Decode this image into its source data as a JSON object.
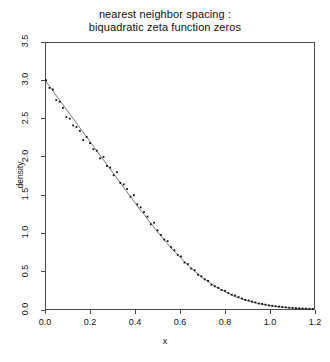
{
  "chart_data": {
    "type": "line",
    "title": "nearest neighbor spacing : biquadratic zeta function zeros",
    "title_lines": [
      "nearest neighbor spacing :",
      "biquadratic zeta function zeros"
    ],
    "xlabel": "x",
    "ylabel": "density",
    "xlim": [
      0.0,
      1.2
    ],
    "ylim": [
      0.0,
      3.5
    ],
    "xticks": [
      "0.0",
      "0.2",
      "0.4",
      "0.6",
      "0.8",
      "1.0",
      "1.2"
    ],
    "xtick_values": [
      0.0,
      0.2,
      0.4,
      0.6,
      0.8,
      1.0,
      1.2
    ],
    "yticks": [
      "0.0",
      "0.5",
      "1.0",
      "1.5",
      "2.0",
      "2.5",
      "3.0",
      "3.5"
    ],
    "ytick_values": [
      0.0,
      0.5,
      1.0,
      1.5,
      2.0,
      2.5,
      3.0,
      3.5
    ],
    "grid": false,
    "legend": "none",
    "marker": "dot",
    "line_color": "#555555",
    "marker_color": "#111111",
    "frame_color": "#4a4a4a",
    "series": [
      {
        "name": "fitted density",
        "type": "line",
        "x": [
          0.0,
          0.02,
          0.04,
          0.06,
          0.08,
          0.1,
          0.12,
          0.14,
          0.16,
          0.18,
          0.2,
          0.22,
          0.24,
          0.26,
          0.28,
          0.3,
          0.32,
          0.34,
          0.36,
          0.38,
          0.4,
          0.42,
          0.44,
          0.46,
          0.48,
          0.5,
          0.52,
          0.54,
          0.56,
          0.58,
          0.6,
          0.62,
          0.64,
          0.66,
          0.68,
          0.7,
          0.72,
          0.74,
          0.76,
          0.78,
          0.8,
          0.82,
          0.84,
          0.86,
          0.88,
          0.9,
          0.92,
          0.94,
          0.96,
          0.98,
          1.0,
          1.02,
          1.04,
          1.06,
          1.08,
          1.1,
          1.12,
          1.14,
          1.16,
          1.18,
          1.2
        ],
        "y": [
          3.0,
          2.92,
          2.84,
          2.76,
          2.68,
          2.6,
          2.52,
          2.44,
          2.36,
          2.28,
          2.2,
          2.12,
          2.04,
          1.96,
          1.88,
          1.8,
          1.72,
          1.64,
          1.56,
          1.48,
          1.4,
          1.32,
          1.25,
          1.17,
          1.1,
          1.02,
          0.95,
          0.88,
          0.81,
          0.75,
          0.69,
          0.63,
          0.57,
          0.52,
          0.47,
          0.42,
          0.38,
          0.34,
          0.3,
          0.27,
          0.24,
          0.21,
          0.18,
          0.16,
          0.14,
          0.12,
          0.105,
          0.09,
          0.078,
          0.067,
          0.057,
          0.048,
          0.041,
          0.035,
          0.03,
          0.026,
          0.022,
          0.019,
          0.016,
          0.014,
          0.012
        ]
      },
      {
        "name": "observed spacings",
        "type": "scatter",
        "x": [
          0.005,
          0.02,
          0.035,
          0.05,
          0.065,
          0.08,
          0.095,
          0.11,
          0.125,
          0.14,
          0.155,
          0.17,
          0.185,
          0.2,
          0.215,
          0.23,
          0.245,
          0.26,
          0.275,
          0.29,
          0.305,
          0.32,
          0.335,
          0.35,
          0.365,
          0.38,
          0.395,
          0.41,
          0.425,
          0.44,
          0.455,
          0.47,
          0.485,
          0.5,
          0.515,
          0.53,
          0.545,
          0.56,
          0.575,
          0.59,
          0.605,
          0.62,
          0.635,
          0.65,
          0.665,
          0.68,
          0.695,
          0.71,
          0.725,
          0.74,
          0.755,
          0.77,
          0.785,
          0.8,
          0.815,
          0.83,
          0.845,
          0.86,
          0.875,
          0.89,
          0.905,
          0.92,
          0.935,
          0.95,
          0.965,
          0.98,
          0.995,
          1.01,
          1.025,
          1.04,
          1.055,
          1.07,
          1.085,
          1.1,
          1.115,
          1.13,
          1.145,
          1.16,
          1.175,
          1.19
        ],
        "y": [
          3.0,
          2.9,
          2.88,
          2.74,
          2.72,
          2.64,
          2.52,
          2.5,
          2.41,
          2.39,
          2.34,
          2.22,
          2.26,
          2.18,
          2.1,
          2.08,
          1.98,
          2.0,
          1.88,
          1.86,
          1.76,
          1.8,
          1.66,
          1.64,
          1.58,
          1.48,
          1.5,
          1.38,
          1.34,
          1.28,
          1.22,
          1.12,
          1.14,
          1.04,
          0.98,
          0.92,
          0.9,
          0.82,
          0.78,
          0.72,
          0.7,
          0.62,
          0.6,
          0.54,
          0.52,
          0.46,
          0.44,
          0.4,
          0.38,
          0.33,
          0.31,
          0.29,
          0.26,
          0.25,
          0.22,
          0.2,
          0.19,
          0.17,
          0.15,
          0.13,
          0.125,
          0.11,
          0.1,
          0.085,
          0.08,
          0.07,
          0.06,
          0.055,
          0.05,
          0.045,
          0.04,
          0.035,
          0.03,
          0.028,
          0.025,
          0.022,
          0.02,
          0.018,
          0.016,
          0.014
        ]
      }
    ]
  }
}
